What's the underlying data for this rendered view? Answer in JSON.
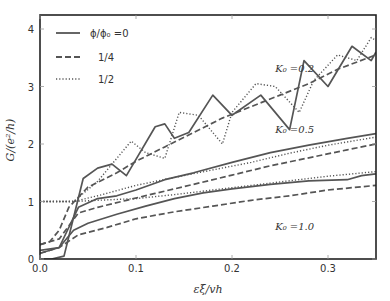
{
  "chart_data": {
    "type": "line",
    "title": "",
    "xlabel": "εξ/vh",
    "ylabel": "G/(e²/h)",
    "xlim": [
      0.0,
      0.35
    ],
    "ylim": [
      -0.08,
      4.3
    ],
    "xticks": [
      "0.0",
      "0.1",
      "0.2",
      "0.3"
    ],
    "xtick_values": [
      0.0,
      0.1,
      0.2,
      0.3
    ],
    "yticks": [
      "0",
      "1",
      "2",
      "3",
      "4"
    ],
    "ytick_values": [
      0,
      1,
      2,
      3,
      4
    ],
    "grid": false,
    "legend": {
      "position": "upper left",
      "entries": [
        {
          "label": "ϕ/ϕ₀ =0",
          "style": "solid"
        },
        {
          "label": "1/4",
          "style": "dashed"
        },
        {
          "label": "1/2",
          "style": "dotted"
        }
      ]
    },
    "annotations": [
      {
        "text": "K₀ =0.2",
        "x": 0.245,
        "y": 3.25
      },
      {
        "text": "K₀ =0.5",
        "x": 0.245,
        "y": 2.2
      },
      {
        "text": "K₀ =1.0",
        "x": 0.245,
        "y": 0.5
      }
    ],
    "series": [
      {
        "name": "K0=0.2, phi/phi0=0",
        "style": "solid",
        "x": [
          0.0,
          0.012,
          0.025,
          0.045,
          0.06,
          0.075,
          0.09,
          0.12,
          0.13,
          0.14,
          0.155,
          0.18,
          0.2,
          0.23,
          0.26,
          0.275,
          0.3,
          0.325,
          0.345,
          0.35
        ],
        "y": [
          0.0,
          0.0,
          0.05,
          1.4,
          1.58,
          1.65,
          1.45,
          2.3,
          2.35,
          2.1,
          2.2,
          2.85,
          2.5,
          2.85,
          2.25,
          3.45,
          3.0,
          3.7,
          3.45,
          3.6
        ]
      },
      {
        "name": "K0=0.2, phi/phi0=1/4",
        "style": "dashed",
        "x": [
          0.0,
          0.01,
          0.02,
          0.03,
          0.05,
          0.08,
          0.1,
          0.13,
          0.16,
          0.19,
          0.22,
          0.25,
          0.28,
          0.31,
          0.35
        ],
        "y": [
          0.25,
          0.3,
          0.5,
          0.9,
          1.25,
          1.5,
          1.7,
          1.95,
          2.2,
          2.45,
          2.65,
          2.85,
          3.05,
          3.3,
          3.55
        ]
      },
      {
        "name": "K0=0.2, phi/phi0=1/2",
        "style": "dotted",
        "x": [
          0.0,
          0.035,
          0.06,
          0.095,
          0.11,
          0.13,
          0.145,
          0.165,
          0.19,
          0.2,
          0.225,
          0.245,
          0.27,
          0.285,
          0.31,
          0.33,
          0.345,
          0.35
        ],
        "y": [
          1.0,
          1.0,
          1.35,
          2.05,
          1.85,
          1.75,
          2.55,
          2.5,
          2.0,
          2.55,
          3.05,
          3.0,
          2.55,
          3.1,
          3.55,
          3.45,
          3.85,
          3.8
        ]
      },
      {
        "name": "K0=0.5, phi/phi0=0",
        "style": "solid",
        "x": [
          0.0,
          0.02,
          0.04,
          0.06,
          0.08,
          0.1,
          0.13,
          0.16,
          0.2,
          0.24,
          0.28,
          0.32,
          0.35
        ],
        "y": [
          0.1,
          0.2,
          0.9,
          1.05,
          1.1,
          1.2,
          1.38,
          1.5,
          1.68,
          1.85,
          1.98,
          2.1,
          2.18
        ]
      },
      {
        "name": "K0=0.5, phi/phi0=1/4",
        "style": "dashed",
        "x": [
          0.0,
          0.02,
          0.04,
          0.06,
          0.09,
          0.12,
          0.16,
          0.2,
          0.24,
          0.28,
          0.32,
          0.35
        ],
        "y": [
          0.25,
          0.35,
          0.8,
          0.9,
          1.02,
          1.14,
          1.3,
          1.46,
          1.62,
          1.76,
          1.9,
          2.0
        ]
      },
      {
        "name": "K0=0.5, phi/phi0=1/2",
        "style": "dotted",
        "x": [
          0.0,
          0.035,
          0.06,
          0.1,
          0.14,
          0.18,
          0.22,
          0.26,
          0.3,
          0.35
        ],
        "y": [
          1.0,
          1.0,
          1.1,
          1.28,
          1.42,
          1.55,
          1.68,
          1.84,
          1.98,
          2.12
        ]
      },
      {
        "name": "K0=1.0, phi/phi0=0",
        "style": "solid",
        "x": [
          0.0,
          0.02,
          0.035,
          0.05,
          0.08,
          0.11,
          0.14,
          0.17,
          0.2,
          0.24,
          0.28,
          0.32,
          0.335,
          0.35
        ],
        "y": [
          0.15,
          0.2,
          0.5,
          0.62,
          0.78,
          0.92,
          1.05,
          1.15,
          1.22,
          1.3,
          1.36,
          1.38,
          1.45,
          1.48
        ]
      },
      {
        "name": "K0=1.0, phi/phi0=1/4",
        "style": "dashed",
        "x": [
          0.0,
          0.02,
          0.04,
          0.07,
          0.1,
          0.14,
          0.18,
          0.22,
          0.26,
          0.3,
          0.35
        ],
        "y": [
          0.1,
          0.2,
          0.42,
          0.55,
          0.7,
          0.82,
          0.92,
          1.02,
          1.1,
          1.2,
          1.28
        ]
      },
      {
        "name": "K0=1.0, phi/phi0=1/2",
        "style": "dotted",
        "x": [
          0.0,
          0.035,
          0.06,
          0.1,
          0.14,
          0.18,
          0.22,
          0.26,
          0.3,
          0.35
        ],
        "y": [
          1.0,
          1.0,
          1.02,
          1.05,
          1.12,
          1.2,
          1.28,
          1.36,
          1.44,
          1.52
        ]
      }
    ]
  },
  "colors": {
    "line": "#555555",
    "axis": "#222222",
    "text": "#333333",
    "background": "#ffffff"
  }
}
